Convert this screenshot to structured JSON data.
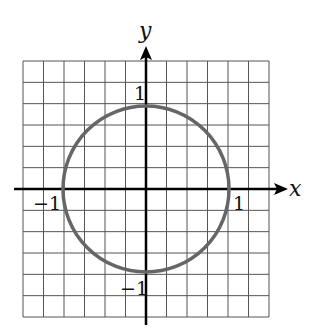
{
  "chart_data": {
    "type": "line",
    "title": "",
    "xlabel": "x",
    "ylabel": "y",
    "xlim": [
      -1.5,
      1.5
    ],
    "ylim": [
      -1.5,
      1.5
    ],
    "grid": true,
    "grid_step": 0.25,
    "tick_labels": {
      "x": [
        "-1",
        "1"
      ],
      "y": [
        "1",
        "-1"
      ]
    },
    "series": [
      {
        "name": "circle",
        "shape": "circle",
        "center": [
          0,
          0
        ],
        "radius": 1,
        "color": "#666666"
      }
    ]
  },
  "labels": {
    "x_axis": "x",
    "y_axis": "y",
    "x_neg": "−1",
    "x_pos": "1",
    "y_pos": "1",
    "y_neg": "−1"
  }
}
